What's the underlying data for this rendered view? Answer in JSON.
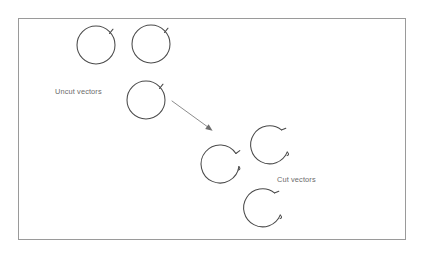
{
  "figure": {
    "background_color": "#ffffff",
    "frame": {
      "x": 18.5,
      "y": 18.5,
      "width": 387,
      "height": 221,
      "stroke_color": "#9a9a9a"
    },
    "line_color": "#4a4a4a",
    "label_color": "#6b6b6b",
    "arrow_color": "#8d8d8d"
  },
  "labels": {
    "uncut": "Uncut vectors",
    "cut": "Cut vectors",
    "uncut_pos": {
      "x": 55,
      "y": 94
    },
    "cut_pos": {
      "x": 277,
      "y": 182
    }
  },
  "diagram_data": {
    "type": "diagram",
    "subject": "plasmid vector restriction digestion",
    "groups": [
      {
        "name": "uncut-vectors",
        "label": "Uncut vectors",
        "state": "circular-closed",
        "count": 3,
        "circles": [
          {
            "id": "uncut-vector-1",
            "cx": 96,
            "cy": 45,
            "r": 19,
            "tick_angle_deg": 52
          },
          {
            "id": "uncut-vector-2",
            "cx": 151,
            "cy": 44,
            "r": 19,
            "tick_angle_deg": 52
          },
          {
            "id": "uncut-vector-3",
            "cx": 146,
            "cy": 100,
            "r": 19,
            "tick_angle_deg": 52
          }
        ]
      },
      {
        "name": "cut-vectors",
        "label": "Cut vectors",
        "state": "linearized-open",
        "count": 3,
        "circles": [
          {
            "id": "cut-vector-1",
            "cx": 222,
            "cy": 160,
            "r": 19,
            "gap_center_deg": 20,
            "gap_span_deg": 36
          },
          {
            "id": "cut-vector-2",
            "cx": 269,
            "cy": 144,
            "r": 19,
            "gap_center_deg": 28,
            "gap_span_deg": 36
          },
          {
            "id": "cut-vector-3",
            "cx": 262,
            "cy": 207,
            "r": 19,
            "gap_center_deg": 28,
            "gap_span_deg": 36
          }
        ]
      }
    ],
    "arrow": {
      "id": "digestion-arrow",
      "from": {
        "x": 172,
        "y": 101
      },
      "to": {
        "x": 212,
        "y": 130
      },
      "meaning": "restriction enzyme cut"
    }
  }
}
